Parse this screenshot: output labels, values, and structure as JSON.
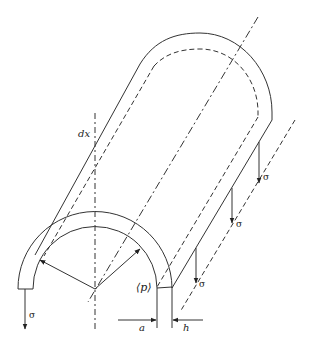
{
  "figure": {
    "type": "engineering diagram",
    "labels": {
      "dx": "dx",
      "p": "⟨p⟩",
      "a": "a",
      "h": "h",
      "sigma": "σ"
    },
    "sigma_count": 4,
    "colors": {
      "line": "#333333",
      "background": "#ffffff"
    }
  }
}
